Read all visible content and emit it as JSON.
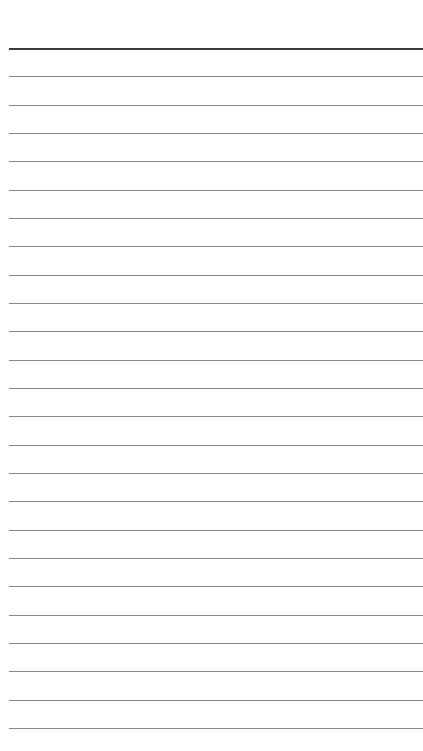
{
  "page": {
    "type": "lined-paper",
    "background_color": "#ffffff",
    "rule_color": "#8a8a8a",
    "header_rule_color": "#3a3a3a",
    "rule_count": 25,
    "first_rule_y": 48,
    "rule_spacing": 28.33,
    "rule_left": 9,
    "text_lines": []
  }
}
